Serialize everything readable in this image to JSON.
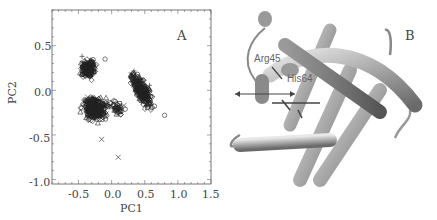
{
  "figure": {
    "panel_a": {
      "label": "A",
      "xlabel": "PC1",
      "ylabel": "PC2",
      "x_ticks": [
        "-0.5",
        "0.0",
        "0.5",
        "1.0",
        "1.5"
      ],
      "y_ticks": [
        "0.5",
        "0.0",
        "-0.5",
        "-1.0"
      ]
    },
    "panel_b": {
      "label": "B",
      "residue_labels": [
        "Arg45",
        "His64"
      ]
    }
  },
  "chart_data": {
    "type": "scatter",
    "title": "",
    "xlabel": "PC1",
    "ylabel": "PC2",
    "xlim": [
      -0.9,
      1.5
    ],
    "ylim": [
      -1.05,
      0.9
    ],
    "x_ticks": [
      -0.5,
      0.0,
      0.5,
      1.0,
      1.5
    ],
    "y_ticks": [
      0.5,
      0.0,
      -0.5,
      -1.0
    ],
    "grid": false,
    "legend": "none",
    "markers": [
      "diamond",
      "circle",
      "triangle",
      "plus",
      "cross",
      "square"
    ],
    "clusters": [
      {
        "name": "cluster-upper-left",
        "center": [
          -0.35,
          0.25
        ],
        "spread": [
          0.08,
          0.08
        ]
      },
      {
        "name": "cluster-lower-left",
        "center": [
          -0.25,
          -0.2
        ],
        "spread": [
          0.15,
          0.1
        ]
      },
      {
        "name": "cluster-right",
        "center": [
          0.45,
          0.0
        ],
        "spread": [
          0.12,
          0.1
        ]
      },
      {
        "name": "bridge",
        "center": [
          0.1,
          -0.2
        ],
        "spread": [
          0.08,
          0.06
        ]
      }
    ],
    "outliers": [
      {
        "x": 0.1,
        "y": -0.75,
        "marker": "cross"
      },
      {
        "x": -0.15,
        "y": -0.55,
        "marker": "cross"
      },
      {
        "x": -0.1,
        "y": 0.35,
        "marker": "circle"
      },
      {
        "x": 0.8,
        "y": -0.28,
        "marker": "circle"
      }
    ]
  }
}
